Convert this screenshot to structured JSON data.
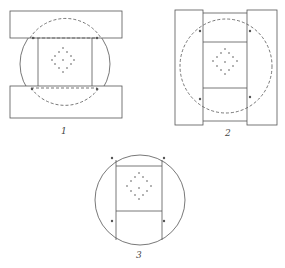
{
  "figures": [
    {
      "id": "fig1",
      "label": "1"
    },
    {
      "id": "fig2",
      "label": "2"
    },
    {
      "id": "fig3",
      "label": "3"
    }
  ],
  "colors": {
    "line": "#555555",
    "background": "#ffffff"
  }
}
